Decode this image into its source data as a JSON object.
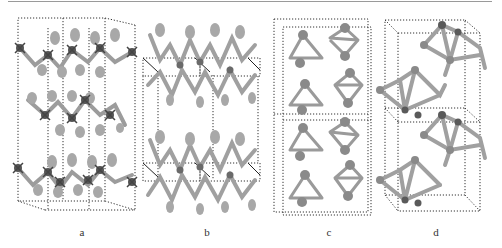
{
  "figure": {
    "panels": [
      {
        "label": "a",
        "description": "layered crystal structure, side view, three zig-zag layers in dotted unit cell"
      },
      {
        "label": "b",
        "description": "layered crystal structure, two corrugated layers with dotted cell outlines"
      },
      {
        "label": "c",
        "description": "crystal structure with triangular clusters in stacked dotted cells"
      },
      {
        "label": "d",
        "description": "crystal structure with puckered clusters in perspective dotted cells"
      }
    ]
  },
  "colors": {
    "atom_light": "#a6a6a6",
    "atom_dark": "#5a5a5a",
    "bond": "#9c9c9c",
    "cell_line": "#333333",
    "rule": "#9a9a9a"
  }
}
